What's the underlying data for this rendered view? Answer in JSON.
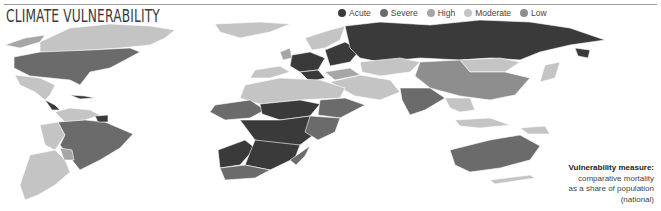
{
  "header": {
    "title": "CLIMATE VULNERABILITY"
  },
  "legend": {
    "items": [
      {
        "label": "Acute",
        "color": "#3a3a3a"
      },
      {
        "label": "Severe",
        "color": "#6b6b6b"
      },
      {
        "label": "High",
        "color": "#a6a6a6"
      },
      {
        "label": "Moderate",
        "color": "#c4c4c4"
      },
      {
        "label": "Low",
        "color": "#8e8e8e"
      }
    ]
  },
  "note": {
    "heading": "Vulnerability measure:",
    "line1": "comparative mortality",
    "line2": "as a share of population",
    "line3": "(national)"
  },
  "colors": {
    "acute": "#3a3a3a",
    "severe": "#6b6b6b",
    "high": "#a6a6a6",
    "moderate": "#c4c4c4",
    "low": "#8e8e8e",
    "rule": "#9a9a9a"
  }
}
